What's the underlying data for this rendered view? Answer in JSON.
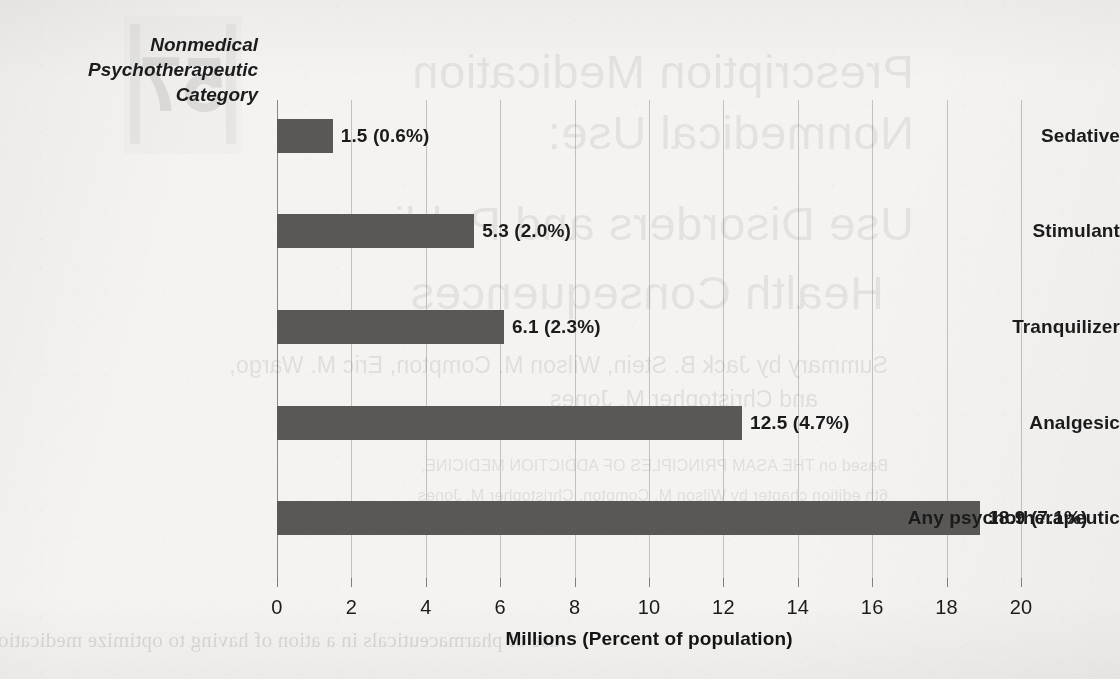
{
  "chart_data": {
    "type": "bar",
    "orientation": "horizontal",
    "title": "",
    "ylabel": "Nonmedical Psychotherapeutic Category",
    "ylabel_lines": [
      "Nonmedical",
      "Psychotherapeutic",
      "Category"
    ],
    "xlabel": "Millions (Percent of population)",
    "categories": [
      "Sedative",
      "Stimulant",
      "Tranquilizer",
      "Analgesic",
      "Any psychotherapeutic"
    ],
    "values": [
      1.5,
      5.3,
      6.1,
      12.5,
      18.9
    ],
    "percents": [
      "0.6%",
      "2.0%",
      "2.3%",
      "4.7%",
      "7.1%"
    ],
    "data_labels": [
      "1.5  (0.6%)",
      "5.3  (2.0%)",
      "6.1  (2.3%)",
      "12.5  (4.7%)",
      "18.9 (7.1%)"
    ],
    "xlim": [
      0,
      20
    ],
    "xticks": [
      0,
      2,
      4,
      6,
      8,
      10,
      12,
      14,
      16,
      18,
      20
    ],
    "xtick_labels": [
      "0",
      "2",
      "4",
      "6",
      "8",
      "10",
      "12",
      "14",
      "16",
      "18",
      "20"
    ],
    "grid": "vertical",
    "legend": "none",
    "bar_color": "#595856",
    "text_color": "#1b1b1b",
    "background_color": "#f4f3f1"
  },
  "bleed_through": {
    "note": "faint mirrored show-through text from the reverse page",
    "badge": "57",
    "lines": [
      "Prescription Medication",
      "Nonmedical Use:",
      "Use Disorders and Public",
      "Health Consequences",
      "Summary by Jack B. Stein, Wilson M. Compton, Eric M. Wargo,",
      "and Christopher M. Jones",
      "Based on THE ASAM PRINCIPLES OF ADDICTION MEDICINE,",
      "6th edition chapter by Wilson M. Compton, Christopher M. Jones",
      "use of pharmaceuticals in a       ation of having to optimize medication dosage"
    ]
  }
}
